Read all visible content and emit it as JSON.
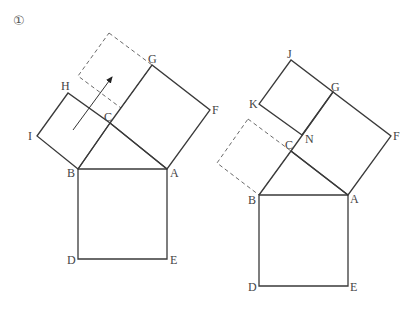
{
  "figure_number": "①",
  "left_figure": {
    "labels": {
      "G": "G",
      "H": "H",
      "I": "I",
      "C": "C",
      "F": "F",
      "B": "B",
      "A": "A",
      "D": "D",
      "E": "E"
    },
    "points": {
      "A": [
        167,
        169
      ],
      "B": [
        78,
        169
      ],
      "C": [
        110,
        123
      ],
      "D": [
        78,
        259
      ],
      "E": [
        167,
        259
      ],
      "F": [
        210,
        110
      ],
      "G": [
        152,
        65
      ],
      "H": [
        68,
        93
      ],
      "I": [
        37,
        136
      ]
    },
    "dashed_square": [
      [
        109,
        33
      ],
      [
        152,
        65
      ],
      [
        121,
        108
      ],
      [
        78,
        76
      ]
    ],
    "arrow": {
      "from": [
        73,
        130
      ],
      "to": [
        113,
        75
      ]
    }
  },
  "right_figure": {
    "labels": {
      "J": "J",
      "K": "K",
      "G": "G",
      "N": "N",
      "C": "C",
      "F": "F",
      "B": "B",
      "A": "A",
      "D": "D",
      "E": "E"
    },
    "points": {
      "A": [
        348,
        195
      ],
      "B": [
        259,
        195
      ],
      "C": [
        291,
        151
      ],
      "D": [
        259,
        286
      ],
      "E": [
        348,
        286
      ],
      "F": [
        391,
        136
      ],
      "G": [
        333,
        92
      ],
      "J": [
        291,
        60
      ],
      "K": [
        259,
        104
      ],
      "N": [
        302,
        135
      ]
    },
    "dashed_square": [
      [
        248,
        119
      ],
      [
        291,
        151
      ],
      [
        259,
        195
      ],
      [
        217,
        163
      ]
    ]
  }
}
